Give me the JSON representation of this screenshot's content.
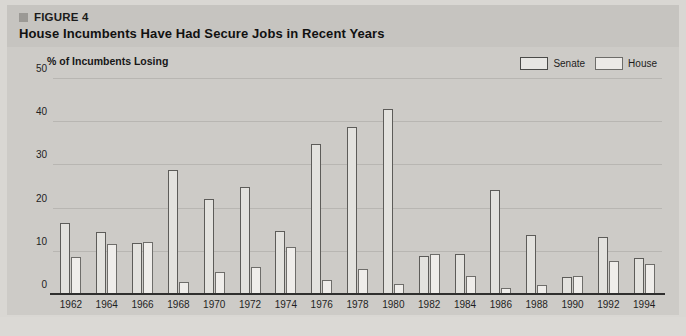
{
  "figure": {
    "marker_icon": "square-bullet-icon",
    "label": "FIGURE 4",
    "title": "House Incumbents Have Had Secure Jobs in Recent Years"
  },
  "legend": {
    "items": [
      {
        "label": "Senate",
        "color": "#e3e2de"
      },
      {
        "label": "House",
        "color": "#efedea"
      }
    ]
  },
  "axis": {
    "y_title": "% of Incumbents Losing",
    "y_ticks": [
      "0",
      "10",
      "20",
      "30",
      "40",
      "50"
    ]
  },
  "chart_data": {
    "type": "bar",
    "title": "House Incumbents Have Had Secure Jobs in Recent Years",
    "xlabel": "",
    "ylabel": "% of Incumbents Losing",
    "ylim": [
      0,
      50
    ],
    "yticks": [
      0,
      10,
      20,
      30,
      40,
      50
    ],
    "grid": true,
    "legend_position": "top-right",
    "categories": [
      "1962",
      "1964",
      "1966",
      "1968",
      "1970",
      "1972",
      "1974",
      "1976",
      "1978",
      "1980",
      "1982",
      "1984",
      "1986",
      "1988",
      "1990",
      "1992",
      "1994"
    ],
    "series": [
      {
        "name": "Senate",
        "values": [
          16.7,
          14.5,
          12.0,
          28.9,
          22.2,
          25.1,
          14.8,
          34.9,
          39.0,
          43.1,
          9.1,
          9.4,
          24.4,
          13.8,
          4.1,
          13.4,
          8.6
        ]
      },
      {
        "name": "House",
        "values": [
          8.9,
          11.7,
          12.2,
          2.9,
          5.3,
          6.5,
          11.2,
          3.5,
          6.1,
          2.6,
          9.6,
          4.5,
          1.7,
          2.4,
          4.3,
          7.9,
          7.2
        ]
      }
    ]
  }
}
